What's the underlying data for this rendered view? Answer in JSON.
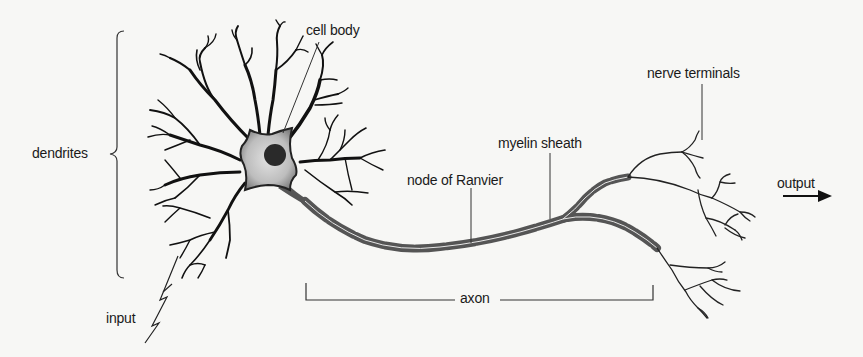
{
  "diagram": {
    "type": "neuron anatomy",
    "labels": {
      "dendrites": "dendrites",
      "cell_body": "cell body",
      "node_of_ranvier": "node of Ranvier",
      "myelin_sheath": "myelin sheath",
      "nerve_terminals": "nerve terminals",
      "output": "output",
      "axon": "axon",
      "input": "input"
    },
    "colors": {
      "background": "#f7f7f5",
      "ink": "#1a1a1a",
      "cell_body_fill": "#c8c8c8",
      "nucleus": "#2a2a2a",
      "myelin": "#555555"
    }
  }
}
